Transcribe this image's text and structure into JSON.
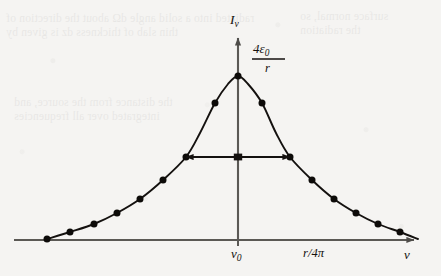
{
  "figure": {
    "kind": "lorentzian-lineshape-plot",
    "axes": {
      "y_label": "I",
      "y_label_sub": "ν",
      "x_label": "ν",
      "x_tick_center": "ν",
      "x_tick_center_sub": "0",
      "x_origin_px": 238,
      "baseline_px": 240,
      "y_arrow_tip_px": 32,
      "x_arrow_end_px": 420
    },
    "annotations": {
      "peak_value_numer": "4ε",
      "peak_value_numer_sub": "0",
      "peak_value_denom": "r",
      "width_label": "r/4π"
    },
    "colors": {
      "ink": "#14110f",
      "curve": "#14110f",
      "axis": "#5b5955",
      "paper": "#f5f4f2",
      "marker": "#0d0b09"
    },
    "ghost_text": [
      {
        "x": 6,
        "y": 12,
        "text": "radiated into a solid angle dΩ about the direction of"
      },
      {
        "x": 6,
        "y": 26,
        "text": "thin slab of thickness dz is given by"
      },
      {
        "x": 300,
        "y": 10,
        "text": "surface normal, so"
      },
      {
        "x": 300,
        "y": 24,
        "text": "the radiation"
      },
      {
        "x": 14,
        "y": 96,
        "text": "the distance from the source, and"
      },
      {
        "x": 14,
        "y": 110,
        "text": "integrated over all frequencies"
      }
    ]
  },
  "chart_data": {
    "type": "line",
    "title": "",
    "xlabel": "ν",
    "ylabel": "Iν",
    "grid": false,
    "legend": false,
    "curve_form": "lorentzian",
    "peak_label": "4ε₀/r",
    "center_tick_label": "ν₀",
    "fwhm_label": "r/4π",
    "peak_height_px": 164,
    "half_max_height_px": 83,
    "fwhm_px": 104,
    "x": [
      47,
      70,
      94,
      117,
      140,
      163,
      186,
      200,
      215,
      228,
      238,
      248,
      262,
      276,
      290,
      312,
      334,
      356,
      378,
      400,
      418
    ],
    "y": [
      239,
      232,
      224,
      213,
      199,
      180,
      157,
      133,
      103,
      84,
      76,
      84,
      103,
      133,
      157,
      180,
      199,
      213,
      224,
      232,
      239
    ],
    "markers_x": [
      47,
      70,
      94,
      117,
      140,
      163,
      186,
      215,
      238,
      262,
      290,
      312,
      334,
      356,
      378,
      400
    ],
    "markers_y": [
      239,
      232,
      224,
      213,
      199,
      180,
      157,
      103,
      76,
      103,
      157,
      180,
      199,
      213,
      224,
      232
    ],
    "fwhm_arrow": {
      "x_left": 186,
      "x_right": 290,
      "y": 157,
      "x_center": 238
    }
  }
}
